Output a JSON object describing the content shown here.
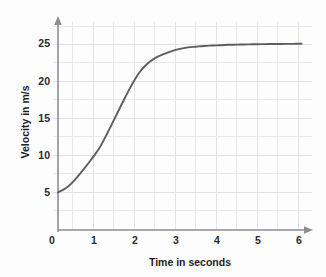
{
  "chart_data": {
    "type": "line",
    "title": "",
    "xlabel": "Time in seconds",
    "ylabel": "Velocity in m/s",
    "xlim": [
      0,
      6.2
    ],
    "ylim": [
      0,
      27
    ],
    "xticks": [
      "0",
      "1",
      "2",
      "3",
      "4",
      "5",
      "6"
    ],
    "xtick_values": [
      0,
      1,
      2,
      3,
      4,
      5,
      6
    ],
    "yticks": [
      "5",
      "10",
      "15",
      "20",
      "25"
    ],
    "ytick_values": [
      5,
      10,
      15,
      20,
      25
    ],
    "grid": true,
    "grid_step_x": 0.5,
    "grid_step_y": 2.5,
    "legend": "none",
    "series": [
      {
        "name": "velocity",
        "color": "#5c5c63",
        "x": [
          0.0,
          0.2,
          0.4,
          0.6,
          0.8,
          1.0,
          1.2,
          1.4,
          1.6,
          1.8,
          2.0,
          2.2,
          2.4,
          2.6,
          2.8,
          3.0,
          3.2,
          3.4,
          3.6,
          3.8,
          4.0,
          4.2,
          4.4,
          4.6,
          4.8,
          5.0,
          5.2,
          5.4,
          5.6,
          5.8,
          6.0
        ],
        "y": [
          5.0,
          5.6,
          6.6,
          7.9,
          9.3,
          10.8,
          12.8,
          15.0,
          17.2,
          19.3,
          21.1,
          22.3,
          23.1,
          23.6,
          24.0,
          24.3,
          24.5,
          24.6,
          24.7,
          24.75,
          24.8,
          24.85,
          24.88,
          24.9,
          24.92,
          24.94,
          24.95,
          24.96,
          24.97,
          24.98,
          25.0
        ]
      }
    ]
  },
  "axis_labels": {
    "x_title": "Time in seconds",
    "y_title": "Velocity in m/s",
    "x_tick_0": "0",
    "x_tick_1": "1",
    "x_tick_2": "2",
    "x_tick_3": "3",
    "x_tick_4": "4",
    "x_tick_5": "5",
    "x_tick_6": "6",
    "y_tick_5": "5",
    "y_tick_10": "10",
    "y_tick_15": "15",
    "y_tick_20": "20",
    "y_tick_25": "25"
  },
  "colors": {
    "curve": "#5c5c63",
    "axis": "#8c8c92",
    "grid": "#e8e9ec",
    "background": "#fdfdfd",
    "text": "#2b2b2b"
  }
}
